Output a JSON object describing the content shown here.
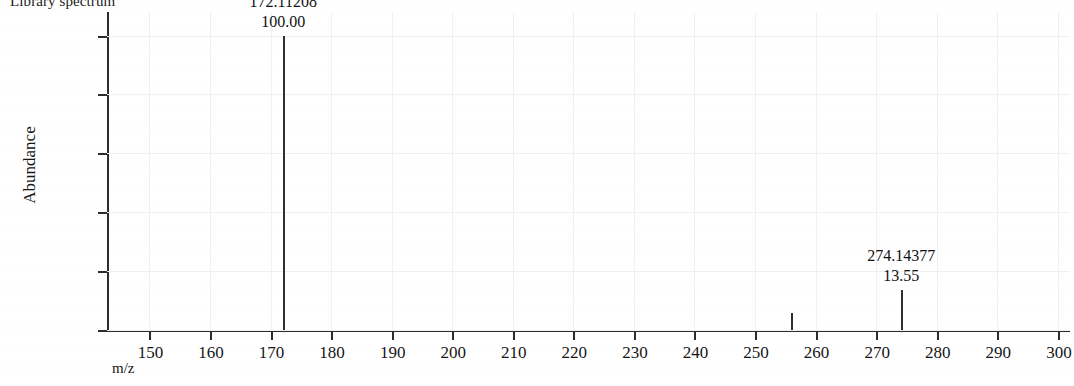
{
  "title": "Library spectrum",
  "axes": {
    "ylabel": "Abundance",
    "xlabel": "m/z",
    "yticks": [
      "0",
      "20",
      "40",
      "60",
      "80",
      "100"
    ],
    "xticks": [
      "150",
      "160",
      "170",
      "180",
      "190",
      "200",
      "210",
      "220",
      "230",
      "240",
      "250",
      "260",
      "270",
      "280",
      "290",
      "300"
    ]
  },
  "annotations": [
    {
      "mz": "172.11208",
      "intensity": "100.00"
    },
    {
      "mz": "274.14377",
      "intensity": "13.55"
    }
  ],
  "colors": {
    "trace": "#2f2f2f",
    "axis": "#2c2c2c",
    "grid": "#f0f0f2",
    "background": "#ffffff"
  },
  "chart_data": {
    "type": "bar",
    "title": "Library spectrum",
    "xlabel": "m/z",
    "ylabel": "Abundance",
    "xlim": [
      143,
      302
    ],
    "ylim": [
      0,
      108
    ],
    "grid": true,
    "legend": null,
    "categories": [
      172.11208,
      256.0,
      274.14377
    ],
    "values": [
      100.0,
      5.7,
      13.55
    ],
    "series": [
      {
        "name": "Library spectrum",
        "points": [
          {
            "mz": 172.11208,
            "abundance": 100.0,
            "label": "172.11208",
            "label_intensity": "100.00"
          },
          {
            "mz": 256.0,
            "abundance": 5.7,
            "label": null,
            "label_intensity": null
          },
          {
            "mz": 274.14377,
            "abundance": 13.55,
            "label": "274.14377",
            "label_intensity": "13.55"
          }
        ]
      }
    ],
    "xticks": [
      150,
      160,
      170,
      180,
      190,
      200,
      210,
      220,
      230,
      240,
      250,
      260,
      270,
      280,
      290,
      300
    ],
    "yticks": [
      0,
      20,
      40,
      60,
      80,
      100
    ],
    "annotations": [
      {
        "x": 172.11208,
        "text": "172.11208\n100.00"
      },
      {
        "x": 274.14377,
        "text": "274.14377\n13.55"
      }
    ]
  }
}
